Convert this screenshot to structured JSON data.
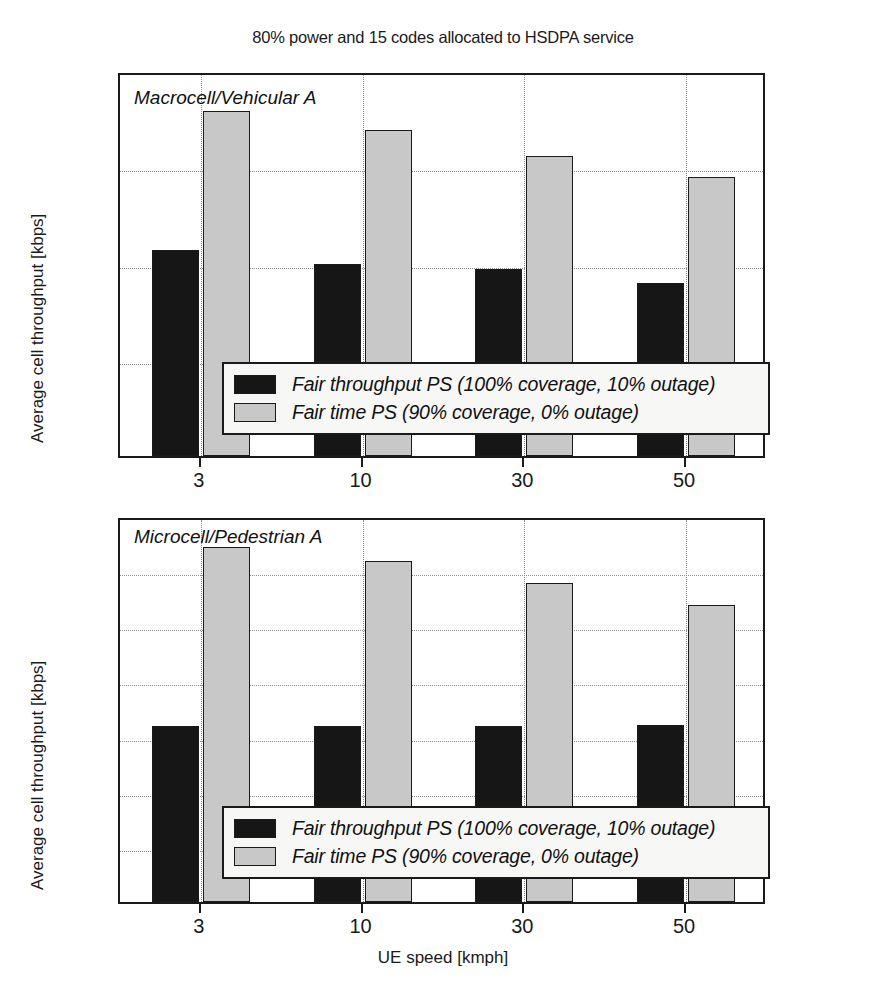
{
  "figure": {
    "title": "80% power and 15 codes allocated to HSDPA service",
    "x_axis_title": "UE speed [kmph]",
    "y_axis_title": "Average cell throughput [kbps]",
    "colors": {
      "series_dark": "#161616",
      "series_light": "#c8c8c8",
      "axis": "#1a1a1a",
      "grid": "#8d8d8d",
      "legend_background": "#f7f7f5"
    },
    "legend": {
      "entries": [
        {
          "label": "Fair throughput PS (100% coverage, 10% outage)",
          "swatch": "dark"
        },
        {
          "label": "Fair time PS (90% coverage, 0% outage)",
          "swatch": "light"
        }
      ]
    }
  },
  "chart_data": [
    {
      "type": "bar",
      "title": "80% power and 15 codes allocated to HSDPA service",
      "annotation": "Macrocell/Vehicular A",
      "xlabel": "UE speed [kmph]",
      "ylabel": "Average cell throughput [kbps]",
      "categories": [
        "3",
        "10",
        "30",
        "50"
      ],
      "ylim": [
        0,
        2000
      ],
      "yticks": [
        0,
        500,
        1000,
        1500,
        2000
      ],
      "grid": true,
      "legend_position": "lower center",
      "series": [
        {
          "name": "Fair throughput PS (100% coverage, 10% outage)",
          "values": [
            1070,
            1000,
            970,
            900
          ]
        },
        {
          "name": "Fair time PS (90% coverage, 0% outage)",
          "values": [
            1790,
            1695,
            1560,
            1450
          ]
        }
      ]
    },
    {
      "type": "bar",
      "annotation": "Microcell/Pedestrian A",
      "xlabel": "UE speed [kmph]",
      "ylabel": "Average cell throughput [kbps]",
      "categories": [
        "3",
        "10",
        "30",
        "50"
      ],
      "ylim": [
        0,
        7000
      ],
      "yticks": [
        0,
        1000,
        2000,
        3000,
        4000,
        5000,
        6000,
        7000
      ],
      "grid": true,
      "legend_position": "lower center",
      "series": [
        {
          "name": "Fair throughput PS (100% coverage, 10% outage)",
          "values": [
            3200,
            3200,
            3200,
            3210
          ]
        },
        {
          "name": "Fair time PS (90% coverage, 0% outage)",
          "values": [
            6430,
            6190,
            5790,
            5390
          ]
        }
      ]
    }
  ]
}
